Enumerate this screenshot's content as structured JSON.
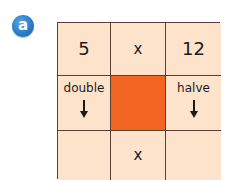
{
  "badge": {
    "label": "a",
    "color": "#2a7cc7"
  },
  "grid": {
    "rows": [
      [
        {
          "type": "number",
          "text": "5"
        },
        {
          "type": "operator",
          "text": "x"
        },
        {
          "type": "number",
          "text": "12"
        }
      ],
      [
        {
          "type": "instruction",
          "text": "double",
          "icon": "down-arrow-icon"
        },
        {
          "type": "highlight",
          "text": "",
          "color": "#f26522"
        },
        {
          "type": "instruction",
          "text": "halve",
          "icon": "down-arrow-icon"
        }
      ],
      [
        {
          "type": "blank",
          "text": ""
        },
        {
          "type": "operator",
          "text": "x"
        },
        {
          "type": "blank",
          "text": ""
        }
      ]
    ],
    "cell_color": "#fde3cc",
    "border_color": "#5a4030"
  }
}
